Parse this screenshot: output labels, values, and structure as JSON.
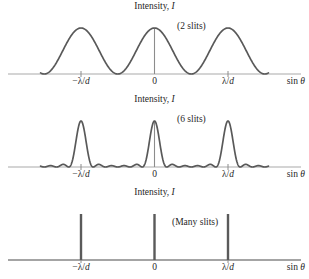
{
  "figure": {
    "axis_label_y": "Intensity, I",
    "axis_label_y_main": "Intensity,",
    "axis_label_y_sym": "I",
    "axis_label_x": "sin θ",
    "axis_label_x_main": "sin",
    "axis_label_x_sym": "θ",
    "tick_left": "−λ/d",
    "tick_left_main": "−λ/",
    "tick_left_sym": "d",
    "tick_center": "0",
    "tick_right": "λ/d",
    "tick_right_main": "λ/",
    "tick_right_sym": "d",
    "curve_color": "#595959",
    "axis_color": "#a9a9a9",
    "text_color": "#1f1f1f"
  },
  "panels": [
    {
      "id": "panel-2slits",
      "name": "two-slit-panel",
      "caption": "(2 slits)",
      "slits": 2
    },
    {
      "id": "panel-6slits",
      "name": "six-slit-panel",
      "caption": "(6 slits)",
      "slits": 6
    },
    {
      "id": "panel-many",
      "name": "many-slit-panel",
      "caption": "(Many slits)",
      "slits": 0
    }
  ],
  "chart_data": [
    {
      "type": "line",
      "title": "Two-slit interference intensity",
      "xlabel": "sin θ",
      "ylabel": "Intensity, I",
      "annotation": "(2 slits)",
      "N": 2,
      "xlim": [
        -1.55,
        1.55
      ],
      "ylim": [
        0,
        1
      ],
      "xtick_values": [
        -1,
        0,
        1
      ],
      "xtick_labels": [
        "−λ/d",
        "0",
        "λ/d"
      ],
      "grid": false,
      "legend": "none",
      "formula": "I = cos^2(pi*x)",
      "principal_maxima_x": [
        -1,
        0,
        1
      ],
      "principal_maxima_y": [
        1,
        1,
        1
      ],
      "minima_x": [
        -1.5,
        -0.5,
        0.5,
        1.5
      ],
      "secondary_maxima_count_between": 0,
      "x": [
        -1.55,
        -1.5,
        -1.4,
        -1.3,
        -1.2,
        -1.1,
        -1.0,
        -0.9,
        -0.8,
        -0.7,
        -0.6,
        -0.5,
        -0.4,
        -0.3,
        -0.2,
        -0.1,
        0.0,
        0.1,
        0.2,
        0.3,
        0.4,
        0.5,
        0.6,
        0.7,
        0.8,
        0.9,
        1.0,
        1.1,
        1.2,
        1.3,
        1.4,
        1.5,
        1.55
      ],
      "values": [
        0.024,
        0.0,
        0.095,
        0.345,
        0.655,
        0.905,
        1.0,
        0.905,
        0.655,
        0.345,
        0.095,
        0.0,
        0.095,
        0.345,
        0.655,
        0.905,
        1.0,
        0.905,
        0.655,
        0.345,
        0.095,
        0.0,
        0.095,
        0.345,
        0.655,
        0.905,
        1.0,
        0.905,
        0.655,
        0.345,
        0.095,
        0.0,
        0.024
      ]
    },
    {
      "type": "line",
      "title": "Six-slit interference intensity",
      "xlabel": "sin θ",
      "ylabel": "Intensity, I",
      "annotation": "(6 slits)",
      "N": 6,
      "xlim": [
        -1.55,
        1.55
      ],
      "ylim": [
        0,
        1
      ],
      "xtick_values": [
        -1,
        0,
        1
      ],
      "xtick_labels": [
        "−λ/d",
        "0",
        "λ/d"
      ],
      "grid": false,
      "legend": "none",
      "formula": "I = (sin(6*pi*x)/(6*sin(pi*x)))^2",
      "principal_maxima_x": [
        -1,
        0,
        1
      ],
      "principal_maxima_y": [
        1,
        1,
        1
      ],
      "secondary_maxima_count_between": 4,
      "secondary_maxima_x": [
        -0.75,
        -0.583,
        -0.417,
        -0.25,
        0.25,
        0.417,
        0.583,
        0.75
      ],
      "secondary_maxima_y": [
        0.056,
        0.025,
        0.017,
        0.047,
        0.047,
        0.017,
        0.025,
        0.056
      ],
      "edge_bump_x": [
        -1.42,
        1.42
      ],
      "edge_bump_y": [
        0.05,
        0.05
      ]
    },
    {
      "type": "bar",
      "title": "Many-slit (grating) interference intensity",
      "xlabel": "sin θ",
      "ylabel": "Intensity, I",
      "annotation": "(Many slits)",
      "N": 0,
      "xlim": [
        -1.55,
        1.55
      ],
      "ylim": [
        0,
        1
      ],
      "xtick_values": [
        -1,
        0,
        1
      ],
      "xtick_labels": [
        "−λ/d",
        "0",
        "λ/d"
      ],
      "grid": false,
      "legend": "none",
      "categories": [
        "−λ/d",
        "0",
        "λ/d"
      ],
      "values": [
        1,
        1,
        1
      ],
      "line_positions_x": [
        -1,
        0,
        1
      ],
      "line_width_note": "delta-function-like sharp lines"
    }
  ]
}
